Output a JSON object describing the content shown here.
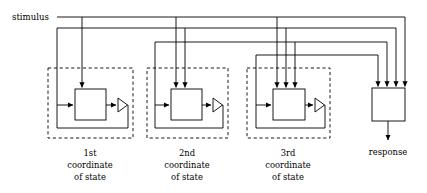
{
  "diagram": {
    "stimulus_label": "stimulus",
    "response_label": "response",
    "modules": [
      {
        "id": "coord1",
        "line1": "1st",
        "line2": "coordinate",
        "line3": "of state",
        "top_inputs": 1
      },
      {
        "id": "coord2",
        "line1": "2nd",
        "line2": "coordinate",
        "line3": "of state",
        "top_inputs": 2
      },
      {
        "id": "coord3",
        "line1": "3rd",
        "line2": "coordinate",
        "line3": "of state",
        "top_inputs": 3
      }
    ],
    "response_box": {
      "top_inputs": 4,
      "output_arrows": 1
    },
    "colors": {
      "line": "#000000",
      "background": "#ffffff",
      "text": "#000000"
    }
  }
}
